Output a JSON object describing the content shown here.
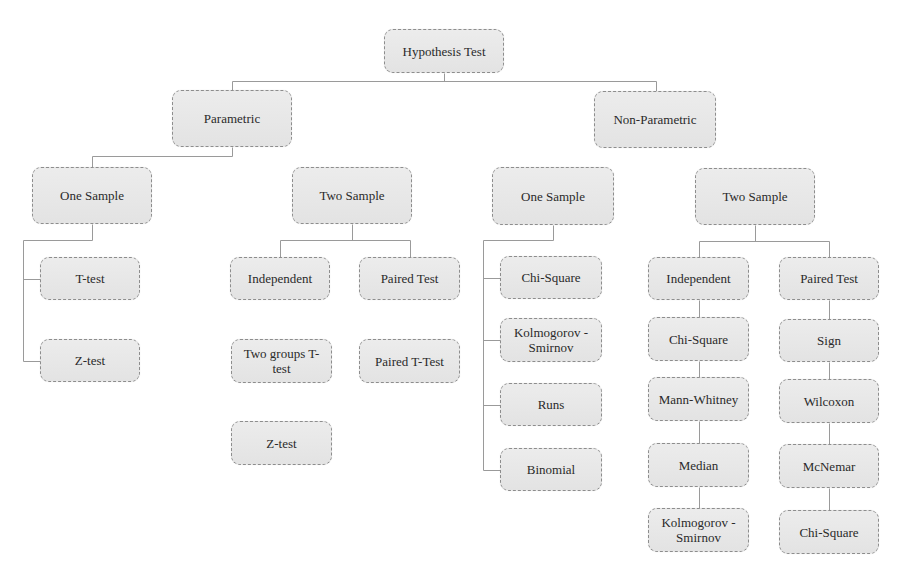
{
  "diagram": {
    "type": "tree",
    "title": "Hypothesis Test",
    "colors": {
      "box_fill": "#e6e6e6",
      "box_border": "#8d8d8d",
      "line": "#9a9a9a",
      "text": "#2a2a2a"
    },
    "nodes": [
      {
        "id": "root",
        "label": "Hypothesis Test",
        "x": 384,
        "y": 29,
        "w": 120,
        "h": 44
      },
      {
        "id": "param",
        "label": "Parametric",
        "x": 172,
        "y": 90,
        "w": 120,
        "h": 57
      },
      {
        "id": "nonparam",
        "label": "Non-Parametric",
        "x": 594,
        "y": 91,
        "w": 122,
        "h": 57
      },
      {
        "id": "p_one",
        "label": "One Sample",
        "x": 32,
        "y": 167,
        "w": 120,
        "h": 57
      },
      {
        "id": "p_two",
        "label": "Two Sample",
        "x": 292,
        "y": 167,
        "w": 120,
        "h": 57
      },
      {
        "id": "np_one",
        "label": "One Sample",
        "x": 492,
        "y": 167,
        "w": 122,
        "h": 58
      },
      {
        "id": "np_two",
        "label": "Two Sample",
        "x": 695,
        "y": 168,
        "w": 120,
        "h": 57
      },
      {
        "id": "p_ttest",
        "label": "T-test",
        "x": 40,
        "y": 257,
        "w": 100,
        "h": 43
      },
      {
        "id": "p_ztest",
        "label": "Z-test",
        "x": 40,
        "y": 339,
        "w": 100,
        "h": 43
      },
      {
        "id": "p_indep",
        "label": "Independent",
        "x": 230,
        "y": 257,
        "w": 100,
        "h": 43
      },
      {
        "id": "p_paired",
        "label": "Paired Test",
        "x": 359,
        "y": 257,
        "w": 101,
        "h": 43
      },
      {
        "id": "p_twogroups",
        "label": "Two groups T-test",
        "x": 231,
        "y": 339,
        "w": 101,
        "h": 44
      },
      {
        "id": "p_pairedt",
        "label": "Paired T-Test",
        "x": 359,
        "y": 339,
        "w": 101,
        "h": 44
      },
      {
        "id": "p_ztest2",
        "label": "Z-test",
        "x": 231,
        "y": 421,
        "w": 101,
        "h": 44
      },
      {
        "id": "np1_chi",
        "label": "Chi-Square",
        "x": 500,
        "y": 256,
        "w": 102,
        "h": 43
      },
      {
        "id": "np1_ks",
        "label": "Kolmogorov - Smirnov",
        "x": 500,
        "y": 318,
        "w": 102,
        "h": 44
      },
      {
        "id": "np1_runs",
        "label": "Runs",
        "x": 500,
        "y": 383,
        "w": 102,
        "h": 43
      },
      {
        "id": "np1_binom",
        "label": "Binomial",
        "x": 500,
        "y": 448,
        "w": 102,
        "h": 43
      },
      {
        "id": "np2_indep",
        "label": "Independent",
        "x": 648,
        "y": 257,
        "w": 101,
        "h": 43
      },
      {
        "id": "np2_chi",
        "label": "Chi-Square",
        "x": 648,
        "y": 317,
        "w": 101,
        "h": 44
      },
      {
        "id": "np2_mann",
        "label": "Mann-Whitney",
        "x": 648,
        "y": 377,
        "w": 101,
        "h": 44
      },
      {
        "id": "np2_median",
        "label": "Median",
        "x": 648,
        "y": 443,
        "w": 101,
        "h": 44
      },
      {
        "id": "np2_ks",
        "label": "Kolmogorov - Smirnov",
        "x": 648,
        "y": 508,
        "w": 101,
        "h": 44
      },
      {
        "id": "np2_paired",
        "label": "Paired Test",
        "x": 779,
        "y": 257,
        "w": 100,
        "h": 43
      },
      {
        "id": "np2_sign",
        "label": "Sign",
        "x": 779,
        "y": 319,
        "w": 100,
        "h": 43
      },
      {
        "id": "np2_wilcoxon",
        "label": "Wilcoxon",
        "x": 779,
        "y": 379,
        "w": 100,
        "h": 44
      },
      {
        "id": "np2_mcnemar",
        "label": "McNemar",
        "x": 779,
        "y": 444,
        "w": 100,
        "h": 44
      },
      {
        "id": "np2_chi2",
        "label": "Chi-Square",
        "x": 779,
        "y": 510,
        "w": 100,
        "h": 44
      }
    ],
    "connectors": [
      [
        [
          444,
          73
        ],
        [
          444,
          81
        ]
      ],
      [
        [
          232,
          81
        ],
        [
          656,
          81
        ]
      ],
      [
        [
          232,
          81
        ],
        [
          232,
          90
        ]
      ],
      [
        [
          656,
          81
        ],
        [
          656,
          91
        ]
      ],
      [
        [
          232,
          147
        ],
        [
          232,
          156
        ]
      ],
      [
        [
          92,
          156
        ],
        [
          232,
          156
        ]
      ],
      [
        [
          92,
          156
        ],
        [
          92,
          167
        ]
      ],
      [
        [
          92,
          224
        ],
        [
          92,
          240
        ]
      ],
      [
        [
          23,
          240
        ],
        [
          92,
          240
        ]
      ],
      [
        [
          23,
          240
        ],
        [
          23,
          361
        ]
      ],
      [
        [
          23,
          279
        ],
        [
          40,
          279
        ]
      ],
      [
        [
          23,
          361
        ],
        [
          40,
          361
        ]
      ],
      [
        [
          352,
          224
        ],
        [
          352,
          240
        ]
      ],
      [
        [
          280,
          240
        ],
        [
          410,
          240
        ]
      ],
      [
        [
          280,
          240
        ],
        [
          280,
          257
        ]
      ],
      [
        [
          410,
          240
        ],
        [
          410,
          257
        ]
      ],
      [
        [
          553,
          225
        ],
        [
          553,
          240
        ]
      ],
      [
        [
          483,
          240
        ],
        [
          553,
          240
        ]
      ],
      [
        [
          483,
          240
        ],
        [
          483,
          470
        ]
      ],
      [
        [
          483,
          278
        ],
        [
          500,
          278
        ]
      ],
      [
        [
          483,
          340
        ],
        [
          500,
          340
        ]
      ],
      [
        [
          483,
          405
        ],
        [
          500,
          405
        ]
      ],
      [
        [
          483,
          470
        ],
        [
          500,
          470
        ]
      ],
      [
        [
          755,
          225
        ],
        [
          755,
          241
        ]
      ],
      [
        [
          699,
          241
        ],
        [
          829,
          241
        ]
      ],
      [
        [
          699,
          241
        ],
        [
          699,
          257
        ]
      ],
      [
        [
          829,
          241
        ],
        [
          829,
          257
        ]
      ],
      [
        [
          699,
          300
        ],
        [
          699,
          317
        ]
      ],
      [
        [
          699,
          361
        ],
        [
          699,
          377
        ]
      ],
      [
        [
          699,
          421
        ],
        [
          699,
          443
        ]
      ],
      [
        [
          699,
          487
        ],
        [
          699,
          508
        ]
      ],
      [
        [
          829,
          300
        ],
        [
          829,
          319
        ]
      ],
      [
        [
          829,
          362
        ],
        [
          829,
          379
        ]
      ],
      [
        [
          829,
          423
        ],
        [
          829,
          444
        ]
      ],
      [
        [
          829,
          488
        ],
        [
          829,
          510
        ]
      ]
    ]
  }
}
